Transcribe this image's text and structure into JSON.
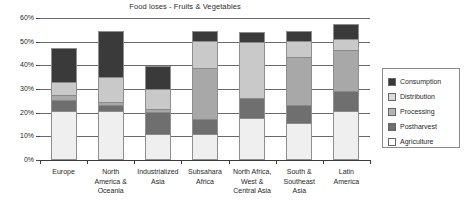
{
  "chart_data": {
    "type": "bar",
    "subtype": "stacked-column",
    "title": "Food loses - Fruits & Vegetables",
    "xlabel": "",
    "ylabel": "",
    "ylim": [
      0,
      60
    ],
    "ytick_values": [
      0,
      10,
      20,
      30,
      40,
      50,
      60
    ],
    "ytick_labels": [
      "0%",
      "10%",
      "20%",
      "30%",
      "40%",
      "50%",
      "60%"
    ],
    "grid": true,
    "grid_axis": "y",
    "legend_position": "right",
    "units": "percent",
    "categories": [
      "Europe",
      "North America & Oceania",
      "Industrialized Asia",
      "Subsahara Africa",
      "North Africa, West & Central Asia",
      "South & Southeast Asia",
      "Latin America"
    ],
    "category_label_lines": [
      [
        "Europe"
      ],
      [
        "North",
        "America &",
        "Oceania"
      ],
      [
        "Industrialized",
        "Asia"
      ],
      [
        "Subsahara",
        "Africa"
      ],
      [
        "North Africa,",
        "West &",
        "Central Asia"
      ],
      [
        "South &",
        "Southeast",
        "Asia"
      ],
      [
        "Latin",
        "America"
      ]
    ],
    "series": [
      {
        "name": "Agriculture",
        "color": "#efefef",
        "values": [
          20,
          20,
          10,
          10,
          17,
          15,
          20
        ]
      },
      {
        "name": "Postharvest",
        "color": "#6f6f6f",
        "values": [
          4,
          2,
          9,
          6,
          8,
          7,
          8
        ]
      },
      {
        "name": "Processing",
        "color": "#a8a8a8",
        "values": [
          2,
          1,
          1,
          21,
          0,
          20,
          17
        ]
      },
      {
        "name": "Distribution",
        "color": "#c9c9c9",
        "values": [
          5,
          10,
          8,
          11,
          23,
          6,
          4
        ]
      },
      {
        "name": "Consumption",
        "color": "#3a3a3a",
        "values": [
          14,
          19,
          9,
          4,
          4,
          4,
          6
        ]
      }
    ],
    "totals": [
      45,
      52,
      37,
      52,
      52,
      52,
      55
    ],
    "stack_order_bottom_to_top": [
      "Agriculture",
      "Postharvest",
      "Processing",
      "Distribution",
      "Consumption"
    ]
  },
  "legend": {
    "items": [
      {
        "label": "Consumption",
        "key": "consumption"
      },
      {
        "label": "Distribution",
        "key": "distribution"
      },
      {
        "label": "Processing",
        "key": "processing"
      },
      {
        "label": "Postharvest",
        "key": "postharvest"
      },
      {
        "label": "Agriculture",
        "key": "agriculture"
      }
    ]
  },
  "colors": {
    "consumption": "#3a3a3a",
    "distribution": "#c9c9c9",
    "processing": "#a8a8a8",
    "postharvest": "#6f6f6f",
    "agriculture": "#efefef",
    "grid": "#6a6a6a",
    "text": "#1f1f1f",
    "background": "#ffffff"
  }
}
